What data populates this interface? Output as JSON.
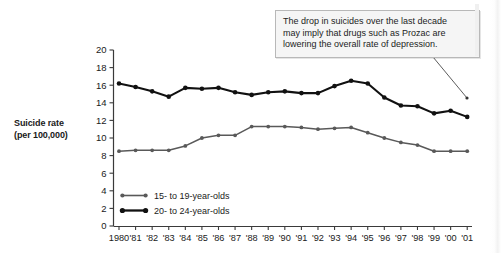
{
  "chart_data": {
    "type": "line",
    "title": "",
    "xlabel": "",
    "ylabel": "Suicide rate\n(per 100,000)",
    "ylabel_line1": "Suicide rate",
    "ylabel_line2": "(per 100,000)",
    "ylim": [
      0,
      20
    ],
    "ytick_step": 2,
    "yticks": [
      "0",
      "2",
      "4",
      "6",
      "8",
      "10",
      "12",
      "14",
      "16",
      "18",
      "20"
    ],
    "ytick_values": [
      0,
      2,
      4,
      6,
      8,
      10,
      12,
      14,
      16,
      18,
      20
    ],
    "grid": false,
    "legend_position": "inside-lower-left",
    "categories": [
      "1980",
      "'81",
      "'82",
      "'83",
      "'84",
      "'85",
      "'86",
      "'87",
      "'88",
      "'89",
      "'90",
      "'91",
      "'92",
      "'93",
      "'94",
      "'95",
      "'96",
      "'97",
      "'98",
      "'99",
      "'00",
      "'01"
    ],
    "x": [
      1980,
      1981,
      1982,
      1983,
      1984,
      1985,
      1986,
      1987,
      1988,
      1989,
      1990,
      1991,
      1992,
      1993,
      1994,
      1995,
      1996,
      1997,
      1998,
      1999,
      2000,
      2001
    ],
    "series": [
      {
        "name": "15- to 19-year-olds",
        "color": "#595959",
        "line_width": 1.5,
        "marker": "circle",
        "values": [
          8.5,
          8.6,
          8.6,
          8.6,
          9.1,
          10.0,
          10.3,
          10.3,
          11.3,
          11.3,
          11.3,
          11.2,
          11.0,
          11.1,
          11.2,
          10.6,
          10.0,
          9.5,
          9.2,
          8.5,
          8.5,
          8.5
        ]
      },
      {
        "name": "20- to 24-year-olds",
        "color": "#111111",
        "line_width": 2.1,
        "marker": "circle",
        "values": [
          16.2,
          15.8,
          15.3,
          14.7,
          15.7,
          15.6,
          15.7,
          15.2,
          14.9,
          15.2,
          15.3,
          15.1,
          15.1,
          15.9,
          16.5,
          16.2,
          14.6,
          13.7,
          13.6,
          12.8,
          13.1,
          12.4
        ]
      }
    ],
    "annotations": [
      {
        "name": "prozac-callout",
        "text": "The drop in suicides over the last decade may imply that drugs such as Prozac are lowering the overall rate of depression.",
        "line1": "The drop in suicides over the last decade",
        "line2": "may imply that drugs such as Prozac are",
        "line3": "lowering the overall rate of depression.",
        "points_to_year": "'01"
      }
    ]
  },
  "legend": {
    "items": [
      {
        "label": "15- to 19-year-olds",
        "color": "#595959"
      },
      {
        "label": "20- to 24-year-olds",
        "color": "#111111"
      }
    ]
  },
  "colors": {
    "axis": "#3a3a3a",
    "text": "#1a1a1a",
    "callout_bg": "#f5f5f5",
    "callout_border": "#b8b8b8",
    "series_young": "#595959",
    "series_older": "#111111",
    "background": "#ffffff"
  }
}
